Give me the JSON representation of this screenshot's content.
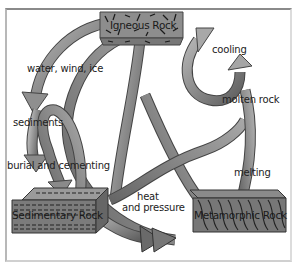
{
  "diagram": {
    "type": "rock-cycle",
    "nodes": [
      {
        "id": "igneous",
        "label": "Igneous Rock"
      },
      {
        "id": "sedimentary",
        "label": "Sedimentary Rock"
      },
      {
        "id": "metamorphic",
        "label": "Metamorphic Rock"
      }
    ],
    "process_labels": {
      "weathering": "water, wind, ice",
      "sediments": "sediments",
      "burial": "burial and cementing",
      "heat": "heat",
      "pressure": "and pressure",
      "melting": "melting",
      "molten": "molten rock",
      "cooling": "cooling"
    },
    "edges": [
      {
        "from": "igneous",
        "to": "sedimentary",
        "label": "water, wind, ice"
      },
      {
        "from": "sedimentary",
        "to": "sedimentary",
        "label": "sediments / burial and cementing"
      },
      {
        "from": "sedimentary",
        "to": "metamorphic",
        "label": "heat and pressure"
      },
      {
        "from": "igneous",
        "to": "metamorphic",
        "label": "heat and pressure"
      },
      {
        "from": "metamorphic",
        "to": "igneous",
        "label": "melting / molten rock / cooling"
      }
    ],
    "colors": {
      "arrow_fill": "#8c8c8c",
      "arrow_dark": "#5a5a5a",
      "block_fill": "#7d7d7d",
      "block_top": "#9a9a9a",
      "frame": "#9a9a9a"
    }
  }
}
